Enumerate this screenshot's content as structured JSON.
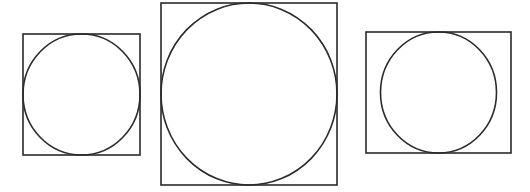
{
  "figure": {
    "width": 530,
    "height": 192,
    "background": "#ffffff",
    "stroke_color": "#2a2a2a",
    "stroke_width": 1.6,
    "shapes": [
      {
        "name": "square-with-inscribed-circle-small",
        "rect": {
          "x": 23,
          "y": 34,
          "w": 117,
          "h": 121
        },
        "circle": {
          "cx": 81.5,
          "cy": 94.5,
          "rx": 58.5,
          "ry": 60.5
        }
      },
      {
        "name": "square-with-inscribed-circle-large",
        "rect": {
          "x": 161,
          "y": 3,
          "w": 176,
          "h": 182
        },
        "circle": {
          "cx": 249,
          "cy": 94,
          "rx": 88,
          "ry": 91
        }
      },
      {
        "name": "rectangle-with-inscribed-circle",
        "rect": {
          "x": 366,
          "y": 32,
          "w": 145,
          "h": 121
        },
        "circle": {
          "cx": 438.5,
          "cy": 92.5,
          "rx": 58,
          "ry": 60.5
        }
      }
    ]
  }
}
